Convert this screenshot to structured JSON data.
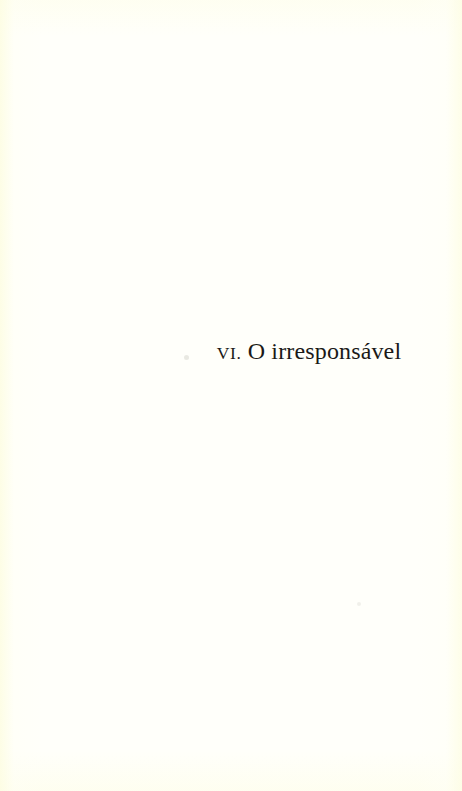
{
  "page": {
    "kind": "book-chapter-half-title",
    "width": 462,
    "height": 791,
    "background_color": "#fffffa",
    "edge_tint_color": "#fdfde2",
    "ink_color": "#1b1a18",
    "language": "pt-BR"
  },
  "chapter": {
    "number_label": "VI.",
    "title": "O irresponsável",
    "full_line": "VI. O irresponsável"
  },
  "artifacts": {
    "speck_primary": "",
    "speck_secondary": ""
  }
}
